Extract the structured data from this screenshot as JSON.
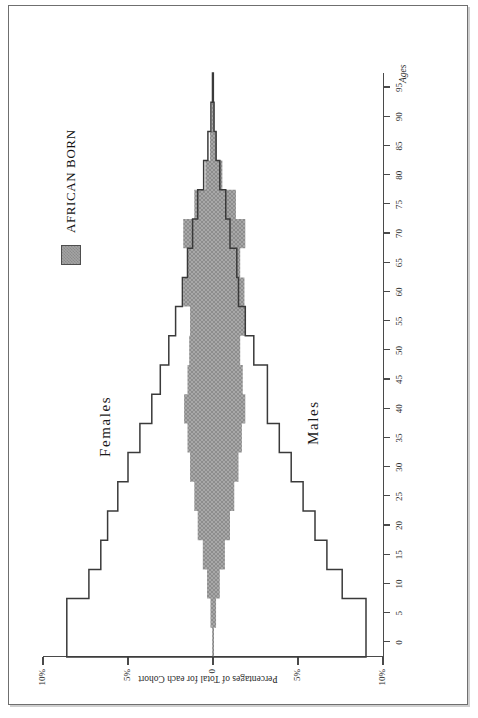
{
  "figure": {
    "legend": {
      "label": "AFRICAN BORN",
      "swatch_color": "#9a9a9a",
      "swatch_name": "african-born-swatch"
    },
    "series_labels": {
      "males": "Males",
      "females": "Females"
    },
    "axis_titles": {
      "percentage": "Percentages of Total for each Cohort",
      "age": "Ages"
    },
    "outline_color": "#3a3a3a",
    "fill_color": "#9c9c9c"
  },
  "chart_data": {
    "type": "bar",
    "orientation": "horizontal-population-pyramid",
    "title": "",
    "xlabel": "Ages",
    "ylabel": "Percentages of Total for each Cohort",
    "categories": [
      0,
      5,
      10,
      15,
      20,
      25,
      30,
      35,
      40,
      45,
      50,
      55,
      60,
      65,
      70,
      75,
      80,
      85,
      90,
      95
    ],
    "age_tick_labels": [
      "0",
      "5",
      "10",
      "15",
      "20",
      "25",
      "30",
      "35",
      "40",
      "45",
      "50",
      "55",
      "60",
      "65",
      "70",
      "75",
      "80",
      "85",
      "90",
      "95"
    ],
    "pct_tick_labels": [
      "10%",
      "5%",
      "0",
      "5%",
      "10%"
    ],
    "pct_tick_values": [
      10,
      5,
      0,
      -5,
      -10
    ],
    "ylim": [
      -10,
      10
    ],
    "grid": false,
    "legend_position": "top-right",
    "series": [
      {
        "name": "Females",
        "key": "females_total",
        "style": "outline",
        "direction": "positive",
        "values": [
          8.6,
          8.6,
          7.3,
          6.6,
          6.2,
          5.6,
          5.0,
          4.3,
          3.6,
          3.1,
          2.6,
          2.2,
          1.8,
          1.5,
          1.2,
          0.9,
          0.55,
          0.3,
          0.12,
          0.03
        ]
      },
      {
        "name": "Males",
        "key": "males_total",
        "style": "outline",
        "direction": "negative",
        "values": [
          9.0,
          9.0,
          7.6,
          6.7,
          6.0,
          5.3,
          4.6,
          3.9,
          3.2,
          3.2,
          2.4,
          1.9,
          1.5,
          1.4,
          1.0,
          0.75,
          0.4,
          0.18,
          0.06,
          0.02
        ]
      },
      {
        "name": "African Born Females",
        "key": "african_born_females",
        "style": "filled",
        "direction": "positive",
        "values": [
          0.05,
          0.15,
          0.35,
          0.6,
          0.9,
          1.1,
          1.35,
          1.5,
          1.7,
          1.5,
          1.4,
          1.35,
          1.75,
          1.5,
          1.75,
          1.1,
          0.45,
          0.18,
          0.06,
          0.02
        ]
      },
      {
        "name": "African Born Males",
        "key": "african_born_males",
        "style": "filled",
        "direction": "negative",
        "values": [
          0.05,
          0.18,
          0.4,
          0.7,
          1.0,
          1.25,
          1.5,
          1.7,
          1.9,
          1.75,
          1.6,
          1.9,
          1.85,
          1.6,
          1.9,
          1.35,
          0.55,
          0.22,
          0.08,
          0.02
        ]
      }
    ]
  }
}
